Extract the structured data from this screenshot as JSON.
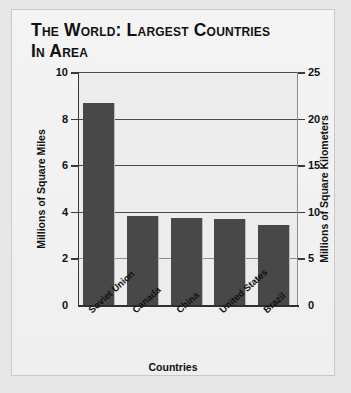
{
  "chart_data": {
    "type": "bar",
    "title": "The World: Largest Countries in Area",
    "title_line1": "The World: Largest Countries",
    "title_line2": "in Area",
    "categories": [
      "Soviet Union",
      "Canada",
      "China",
      "United States",
      "Brazil"
    ],
    "values": [
      8.65,
      3.8,
      3.75,
      3.7,
      3.45
    ],
    "series": [
      {
        "name": "Area",
        "values": [
          8.65,
          3.8,
          3.75,
          3.7,
          3.45
        ]
      }
    ],
    "xlabel": "Countries",
    "ylabel": "Millions of Square Miles",
    "ylabel_secondary": "Millions of Square Kilometers",
    "ylim": [
      0,
      10
    ],
    "ylim_secondary": [
      0,
      25
    ],
    "yticks": [
      "0",
      "2",
      "4",
      "6",
      "8",
      "10"
    ],
    "yticks_secondary": [
      "0",
      "5",
      "10",
      "15",
      "20",
      "25"
    ],
    "grid": true,
    "legend": "none",
    "bar_color": "#484848",
    "plot_background": "#ececec",
    "axis_color": "#333333"
  }
}
